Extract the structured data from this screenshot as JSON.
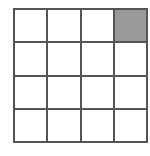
{
  "diagram": {
    "type": "grid",
    "rows": 4,
    "columns": 4,
    "line_color": "#555555",
    "cell_color": "#ffffff",
    "shaded_color": "#999999",
    "shaded_cells": [
      {
        "row": 0,
        "col": 3
      }
    ],
    "cells": [
      [
        0,
        0,
        0,
        1
      ],
      [
        0,
        0,
        0,
        0
      ],
      [
        0,
        0,
        0,
        0
      ],
      [
        0,
        0,
        0,
        0
      ]
    ]
  }
}
